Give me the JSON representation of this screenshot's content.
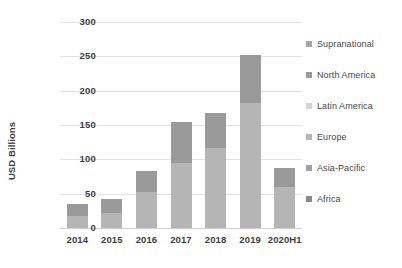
{
  "chart_data": {
    "type": "bar",
    "stacked": true,
    "title": "",
    "subtitle": "",
    "xlabel": "",
    "ylabel": "USD Billions",
    "categories": [
      "2014",
      "2015",
      "2016",
      "2017",
      "2018",
      "2019",
      "2020H1"
    ],
    "ylim": [
      0,
      300
    ],
    "yticks": [
      0,
      50,
      100,
      150,
      200,
      250,
      300
    ],
    "ytick_labels": [
      "0",
      "50",
      "100",
      "150",
      "200",
      "250",
      "300"
    ],
    "grid": true,
    "legend_position": "right",
    "series": [
      {
        "name": "Supranational",
        "color": "#a6a6a6",
        "values": [
          0,
          0,
          0,
          0,
          0,
          0,
          0
        ]
      },
      {
        "name": "North America",
        "color": "#9a9a9a",
        "values": [
          18,
          20,
          31,
          59,
          51,
          70,
          27
        ]
      },
      {
        "name": "Latin America",
        "color": "#d4d4d4",
        "values": [
          0,
          0,
          0,
          0,
          0,
          0,
          0
        ]
      },
      {
        "name": "Europe",
        "color": "#b5b5b5",
        "values": [
          17,
          22,
          52,
          95,
          116,
          182,
          60
        ]
      },
      {
        "name": "Asia-Pacific",
        "color": "#a0a0a0",
        "values": [
          0,
          0,
          0,
          0,
          0,
          0,
          0
        ]
      },
      {
        "name": "Africa",
        "color": "#8a8a8a",
        "values": [
          0,
          0,
          0,
          0,
          0,
          0,
          0
        ]
      }
    ],
    "totals": [
      35,
      42,
      83,
      154,
      167,
      252,
      87
    ],
    "bars": [
      {
        "category": "2014",
        "total": 35,
        "segments": [
          {
            "series": "Europe",
            "value": 17,
            "color": "#b5b5b5"
          },
          {
            "series": "North America",
            "value": 18,
            "color": "#9a9a9a"
          }
        ]
      },
      {
        "category": "2015",
        "total": 42,
        "segments": [
          {
            "series": "Europe",
            "value": 22,
            "color": "#b5b5b5"
          },
          {
            "series": "North America",
            "value": 20,
            "color": "#9a9a9a"
          }
        ]
      },
      {
        "category": "2016",
        "total": 83,
        "segments": [
          {
            "series": "Europe",
            "value": 52,
            "color": "#b5b5b5"
          },
          {
            "series": "North America",
            "value": 31,
            "color": "#9a9a9a"
          }
        ]
      },
      {
        "category": "2017",
        "total": 154,
        "segments": [
          {
            "series": "Europe",
            "value": 95,
            "color": "#b5b5b5"
          },
          {
            "series": "North America",
            "value": 59,
            "color": "#9a9a9a"
          }
        ]
      },
      {
        "category": "2018",
        "total": 167,
        "segments": [
          {
            "series": "Europe",
            "value": 116,
            "color": "#b5b5b5"
          },
          {
            "series": "North America",
            "value": 51,
            "color": "#9a9a9a"
          }
        ]
      },
      {
        "category": "2019",
        "total": 252,
        "segments": [
          {
            "series": "Europe",
            "value": 182,
            "color": "#b5b5b5"
          },
          {
            "series": "North America",
            "value": 70,
            "color": "#9a9a9a"
          }
        ]
      },
      {
        "category": "2020H1",
        "total": 87,
        "segments": [
          {
            "series": "Europe",
            "value": 60,
            "color": "#b5b5b5"
          },
          {
            "series": "North America",
            "value": 27,
            "color": "#9a9a9a"
          }
        ]
      }
    ]
  },
  "legend": {
    "items": [
      {
        "label": "Supranational",
        "color": "#a6a6a6"
      },
      {
        "label": "North America",
        "color": "#9a9a9a"
      },
      {
        "label": "Latin America",
        "color": "#d4d4d4"
      },
      {
        "label": "Europe",
        "color": "#b5b5b5"
      },
      {
        "label": "Asia-Pacific",
        "color": "#a0a0a0"
      },
      {
        "label": "Africa",
        "color": "#8a8a8a"
      }
    ]
  },
  "colors": {
    "grid": "#e2e2e2",
    "axis": "#cfcfcf",
    "text": "#3d3d3d",
    "background": "#ffffff"
  }
}
